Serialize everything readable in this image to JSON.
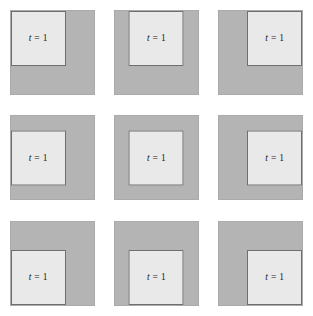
{
  "figure": {
    "title": "",
    "grid": {
      "rows": 3,
      "columns": 3
    },
    "colors": {
      "background": "#ffffff",
      "outer_square_fill": "#b4b4b4",
      "outer_square_stroke": "#aaaaaa",
      "inner_square_fill": "#e9e9e9",
      "inner_square_stroke": "#6f6f6f",
      "label_text": "#1a1a1a"
    },
    "panels": [
      {
        "id": "panel-1",
        "row": 1,
        "column": 1,
        "inner_position": "top-left",
        "label_variable": "t",
        "label_operator": "=",
        "label_value": "1"
      },
      {
        "id": "panel-2",
        "row": 1,
        "column": 2,
        "inner_position": "top-center",
        "label_variable": "t",
        "label_operator": "=",
        "label_value": "1"
      },
      {
        "id": "panel-3",
        "row": 1,
        "column": 3,
        "inner_position": "top-right",
        "label_variable": "t",
        "label_operator": "=",
        "label_value": "1"
      },
      {
        "id": "panel-4",
        "row": 2,
        "column": 1,
        "inner_position": "middle-left",
        "label_variable": "t",
        "label_operator": "=",
        "label_value": "1"
      },
      {
        "id": "panel-5",
        "row": 2,
        "column": 2,
        "inner_position": "middle-center",
        "label_variable": "t",
        "label_operator": "=",
        "label_value": "1"
      },
      {
        "id": "panel-6",
        "row": 2,
        "column": 3,
        "inner_position": "middle-right",
        "label_variable": "t",
        "label_operator": "=",
        "label_value": "1"
      },
      {
        "id": "panel-7",
        "row": 3,
        "column": 1,
        "inner_position": "bottom-left",
        "label_variable": "t",
        "label_operator": "=",
        "label_value": "1"
      },
      {
        "id": "panel-8",
        "row": 3,
        "column": 2,
        "inner_position": "bottom-center",
        "label_variable": "t",
        "label_operator": "=",
        "label_value": "1"
      },
      {
        "id": "panel-9",
        "row": 3,
        "column": 3,
        "inner_position": "bottom-right",
        "label_variable": "t",
        "label_operator": "=",
        "label_value": "1"
      }
    ]
  }
}
